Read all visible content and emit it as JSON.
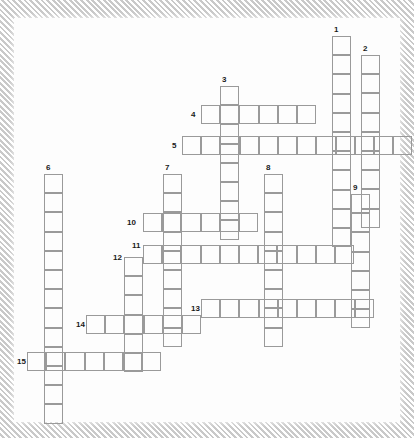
{
  "puzzle": {
    "kind": "crossword-grid",
    "title": "",
    "cell_size": 19.2,
    "grid_origin": {
      "x": 13,
      "y": 37
    },
    "colors": {
      "cell_border": "#9a9a9a",
      "number_text": "#1a1a1a",
      "paper": "#fdfdfd",
      "frame_hatch_light": "#ffffff",
      "frame_hatch_dark": "#c9c9c9"
    },
    "entry_count": 15,
    "entries": [
      {
        "number": "1",
        "direction": "down",
        "length": 11,
        "x": 318,
        "y": 18,
        "number_x": 320,
        "number_y": 8
      },
      {
        "number": "2",
        "direction": "down",
        "length": 9,
        "x": 347,
        "y": 37,
        "number_x": 349,
        "number_y": 27
      },
      {
        "number": "3",
        "direction": "down",
        "length": 8,
        "x": 206,
        "y": 68,
        "number_x": 208,
        "number_y": 58
      },
      {
        "number": "4",
        "direction": "across",
        "length": 6,
        "x": 187,
        "y": 87,
        "number_x": 177,
        "number_y": 93
      },
      {
        "number": "5",
        "direction": "across",
        "length": 12,
        "x": 168,
        "y": 118,
        "number_x": 158,
        "number_y": 124
      },
      {
        "number": "6",
        "direction": "down",
        "length": 13,
        "x": 30,
        "y": 156,
        "number_x": 32,
        "number_y": 146
      },
      {
        "number": "7",
        "direction": "down",
        "length": 9,
        "x": 149,
        "y": 156,
        "number_x": 151,
        "number_y": 146
      },
      {
        "number": "8",
        "direction": "down",
        "length": 9,
        "x": 250,
        "y": 156,
        "number_x": 252,
        "number_y": 146
      },
      {
        "number": "9",
        "direction": "down",
        "length": 7,
        "x": 337,
        "y": 176,
        "number_x": 339,
        "number_y": 166
      },
      {
        "number": "10",
        "direction": "across",
        "length": 6,
        "x": 129,
        "y": 195,
        "number_x": 113,
        "number_y": 201
      },
      {
        "number": "11",
        "direction": "across",
        "length": 11,
        "x": 129,
        "y": 227,
        "number_x": 118,
        "number_y": 224
      },
      {
        "number": "12",
        "direction": "down",
        "length": 6,
        "x": 110,
        "y": 239,
        "number_x": 99,
        "number_y": 236
      },
      {
        "number": "13",
        "direction": "across",
        "length": 9,
        "x": 187,
        "y": 281,
        "number_x": 177,
        "number_y": 287
      },
      {
        "number": "14",
        "direction": "across",
        "length": 6,
        "x": 72,
        "y": 297,
        "number_x": 62,
        "number_y": 303
      },
      {
        "number": "15",
        "direction": "across",
        "length": 7,
        "x": 13,
        "y": 334,
        "number_x": 3,
        "number_y": 340
      }
    ]
  }
}
